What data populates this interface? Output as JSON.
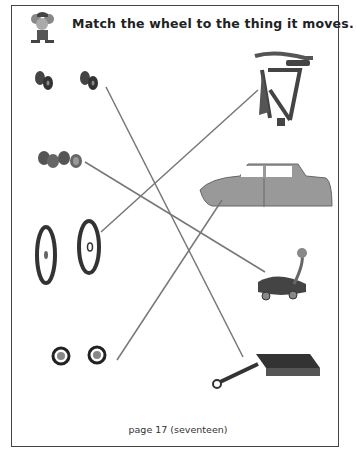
{
  "worksheet": {
    "title": "Match the wheel to the thing it moves.",
    "footer": "page 17 (seventeen)",
    "mascot": "mouse-mascot",
    "left_column": [
      {
        "id": "car-wheels",
        "icon": "dark-tire-pairs-icon"
      },
      {
        "id": "skate-wheels",
        "icon": "small-wheels-icon"
      },
      {
        "id": "bicycle-wheels",
        "icon": "spoked-bike-wheels-icon"
      },
      {
        "id": "wagon-wheels",
        "icon": "small-round-wheels-icon"
      }
    ],
    "right_column": [
      {
        "id": "bicycle",
        "icon": "bicycle-frame-icon"
      },
      {
        "id": "car",
        "icon": "car-body-icon"
      },
      {
        "id": "scooter",
        "icon": "ride-on-toy-icon"
      },
      {
        "id": "wagon",
        "icon": "wagon-icon"
      }
    ],
    "match_lines": [
      {
        "from": "car-wheels",
        "to": "wagon"
      },
      {
        "from": "skate-wheels",
        "to": "scooter"
      },
      {
        "from": "bicycle-wheels",
        "to": "bicycle"
      },
      {
        "from": "wagon-wheels",
        "to": "car"
      }
    ],
    "colors": {
      "line": "#777777",
      "border": "#444444",
      "text": "#222222"
    }
  }
}
